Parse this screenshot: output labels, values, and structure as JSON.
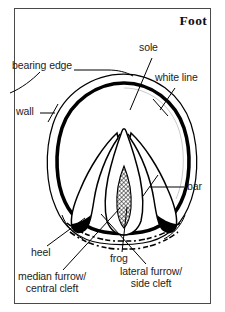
{
  "figure": {
    "title": "Foot",
    "frame": {
      "border_color": "#4a4a4a",
      "background": "#ffffff"
    },
    "ink_color": "#000000",
    "labels": [
      {
        "key": "bearing_edge",
        "text": "bearing edge",
        "x": 12,
        "y": 66
      },
      {
        "key": "sole",
        "text": "sole",
        "x": 139,
        "y": 48
      },
      {
        "key": "white_line",
        "text": "white line",
        "x": 157,
        "y": 78
      },
      {
        "key": "wall",
        "text": "wall",
        "x": 16,
        "y": 110
      },
      {
        "key": "bar",
        "text": "bar",
        "x": 186,
        "y": 183
      },
      {
        "key": "heel",
        "text": "heel",
        "x": 32,
        "y": 250
      },
      {
        "key": "frog",
        "text": "frog",
        "x": 111,
        "y": 256
      },
      {
        "key": "median_furrow",
        "text": "median furrow/\ncentral cleft",
        "x": 21,
        "y": 273
      },
      {
        "key": "lateral_furrow",
        "text": "lateral furrow/\nside cleft",
        "x": 122,
        "y": 268
      }
    ],
    "parts": [
      "wall",
      "bearing edge",
      "white line",
      "sole",
      "bar",
      "frog",
      "heel",
      "median furrow / central cleft",
      "lateral furrow / side cleft"
    ]
  }
}
